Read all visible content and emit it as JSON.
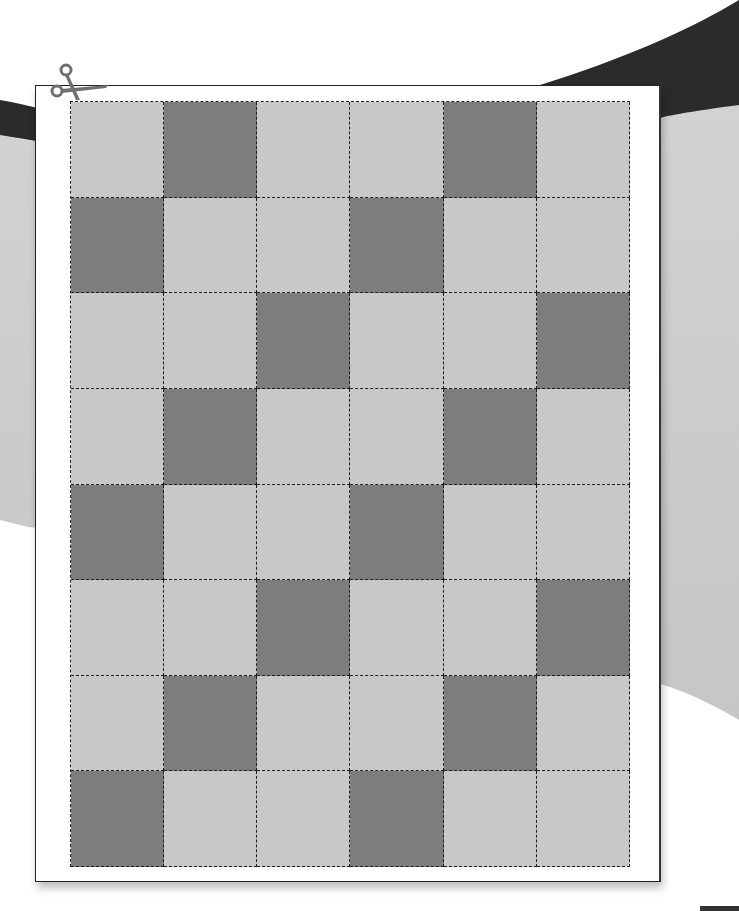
{
  "canvas": {
    "width": 739,
    "height": 911
  },
  "colors": {
    "page_background": "#ffffff",
    "backdrop_gray": "#cfcfcf",
    "backdrop_ribbon": "#2a2a2a",
    "sheet": "#ffffff",
    "cell_light": "#c8c8c8",
    "cell_dark": "#7d7d7d",
    "cut_line": "#1e1e1e",
    "scissors": "#6e6e6e"
  },
  "icons": {
    "scissors": "scissors-icon"
  },
  "grid": {
    "columns": 6,
    "rows": 8,
    "pattern": [
      [
        0,
        1,
        0,
        0,
        1,
        0
      ],
      [
        1,
        0,
        0,
        1,
        0,
        0
      ],
      [
        0,
        0,
        1,
        0,
        0,
        1
      ],
      [
        0,
        1,
        0,
        0,
        1,
        0
      ],
      [
        1,
        0,
        0,
        1,
        0,
        0
      ],
      [
        0,
        0,
        1,
        0,
        0,
        1
      ],
      [
        0,
        1,
        0,
        0,
        1,
        0
      ],
      [
        1,
        0,
        0,
        1,
        0,
        0
      ]
    ]
  }
}
